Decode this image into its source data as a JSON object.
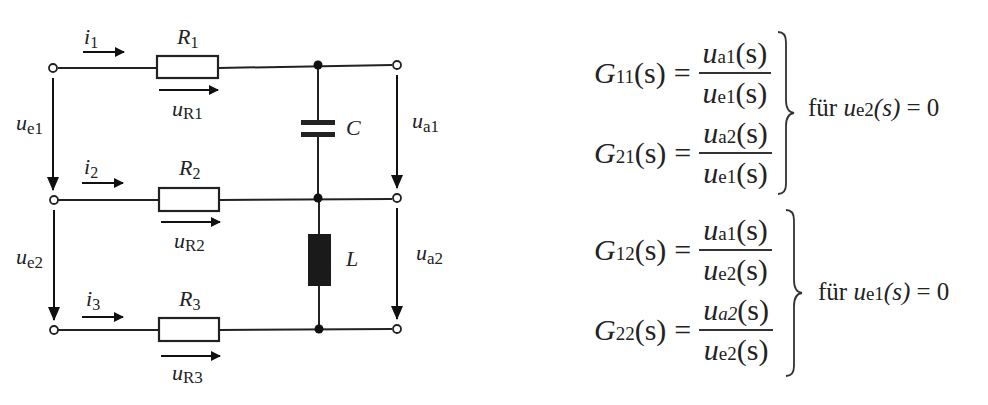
{
  "circuit": {
    "currents": [
      {
        "label": "i",
        "sub": "1"
      },
      {
        "label": "i",
        "sub": "2"
      },
      {
        "label": "i",
        "sub": "3"
      }
    ],
    "resistors": [
      {
        "label": "R",
        "sub": "1",
        "voltage": "u",
        "voltage_sub": "R1"
      },
      {
        "label": "R",
        "sub": "2",
        "voltage": "u",
        "voltage_sub": "R2"
      },
      {
        "label": "R",
        "sub": "3",
        "voltage": "u",
        "voltage_sub": "R3"
      }
    ],
    "inputs": [
      {
        "label": "u",
        "sub": "e1"
      },
      {
        "label": "u",
        "sub": "e2"
      }
    ],
    "outputs": [
      {
        "label": "u",
        "sub": "a1"
      },
      {
        "label": "u",
        "sub": "a2"
      }
    ],
    "capacitor": {
      "label": "C"
    },
    "inductor": {
      "label": "L"
    }
  },
  "equations": [
    {
      "G": "G",
      "idx": "11",
      "arg": "(s)",
      "num": "u",
      "num_sub": "a1",
      "den": "u",
      "den_sub": "e1"
    },
    {
      "G": "G",
      "idx": "21",
      "arg": "(s)",
      "num": "u",
      "num_sub": "a2",
      "den": "u",
      "den_sub": "e1"
    },
    {
      "G": "G",
      "idx": "12",
      "arg": "(s)",
      "num": "u",
      "num_sub": "a1",
      "den": "u",
      "den_sub": "e2"
    },
    {
      "G": "G",
      "idx": "22",
      "arg": "(s)",
      "num": "u",
      "num_sub": "a2",
      "den": "u",
      "den_sub": "e2"
    }
  ],
  "conditions": [
    {
      "prefix": "für",
      "var": "u",
      "sub": "e2",
      "arg": "(s)",
      "rhs": "= 0"
    },
    {
      "prefix": "für",
      "var": "u",
      "sub": "e1",
      "arg": "(s)",
      "rhs": "= 0"
    }
  ],
  "symbols": {
    "s": "(s)",
    "equals": "="
  }
}
